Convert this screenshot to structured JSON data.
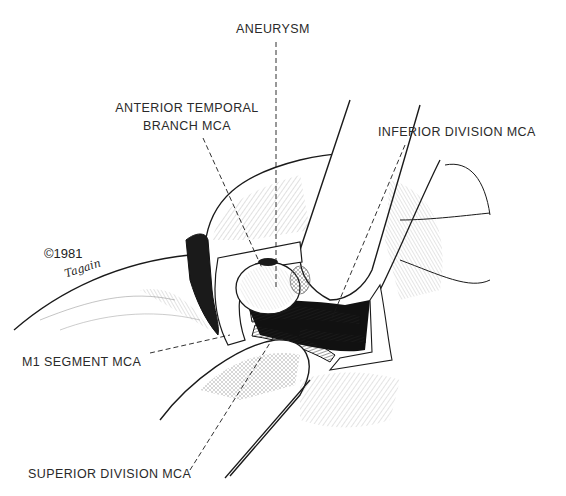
{
  "figure": {
    "type": "surgical-illustration",
    "style": "black ink line drawing on white",
    "labels": {
      "aneurysm": "ANEURYSM",
      "anterior_temporal_line1": "ANTERIOR TEMPORAL",
      "anterior_temporal_line2": "BRANCH MCA",
      "inferior_division": "INFERIOR DIVISION MCA",
      "m1_segment": "M1 SEGMENT MCA",
      "superior_division": "SUPERIOR DIVISION MCA"
    },
    "credit": {
      "copyright": "©1981",
      "artist": "Tagain"
    },
    "colors": {
      "ink": "#1a1a1a",
      "paper": "#ffffff",
      "label_text": "#2a2a2a"
    }
  }
}
